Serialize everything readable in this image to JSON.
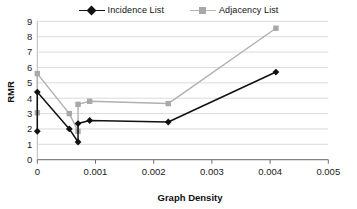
{
  "legend": {
    "position": "top-center",
    "entries": [
      {
        "label": "Incidence List",
        "marker": "diamond-marker-icon",
        "color": "#111111"
      },
      {
        "label": "Adjacency List",
        "marker": "square-marker-icon",
        "color": "#a8a8a8"
      }
    ]
  },
  "chart_data": {
    "type": "line",
    "title": "",
    "xlabel": "Graph Density",
    "ylabel": "RMR",
    "xlim": [
      0,
      0.005
    ],
    "ylim": [
      0,
      9
    ],
    "xticks": [
      "0",
      "0.001",
      "0.002",
      "0.003",
      "0.004",
      "0.005"
    ],
    "xtick_values": [
      0,
      0.001,
      0.002,
      0.003,
      0.004,
      0.005
    ],
    "yticks": [
      "0",
      "1",
      "2",
      "3",
      "4",
      "5",
      "6",
      "7",
      "8",
      "9"
    ],
    "ytick_values": [
      0,
      1,
      2,
      3,
      4,
      5,
      6,
      7,
      8,
      9
    ],
    "grid": "horizontal",
    "legend_position": "top-center",
    "series": [
      {
        "name": "Incidence List",
        "color": "#111111",
        "marker": "diamond",
        "points": [
          {
            "x": 0,
            "y": 1.85
          },
          {
            "x": 0,
            "y": 4.4
          },
          {
            "x": 0.00055,
            "y": 2.0
          },
          {
            "x": 0.0007,
            "y": 1.15
          },
          {
            "x": 0.0007,
            "y": 2.35
          },
          {
            "x": 0.0009,
            "y": 2.55
          },
          {
            "x": 0.00225,
            "y": 2.45
          },
          {
            "x": 0.0041,
            "y": 5.7
          }
        ]
      },
      {
        "name": "Adjacency List",
        "color": "#b0b0b0",
        "marker": "square",
        "points": [
          {
            "x": 0,
            "y": 3.05
          },
          {
            "x": 0,
            "y": 5.6
          },
          {
            "x": 0.00055,
            "y": 3.0
          },
          {
            "x": 0.0007,
            "y": 1.85
          },
          {
            "x": 0.0007,
            "y": 3.6
          },
          {
            "x": 0.0009,
            "y": 3.8
          },
          {
            "x": 0.00225,
            "y": 3.65
          },
          {
            "x": 0.0041,
            "y": 8.55
          }
        ]
      }
    ]
  }
}
